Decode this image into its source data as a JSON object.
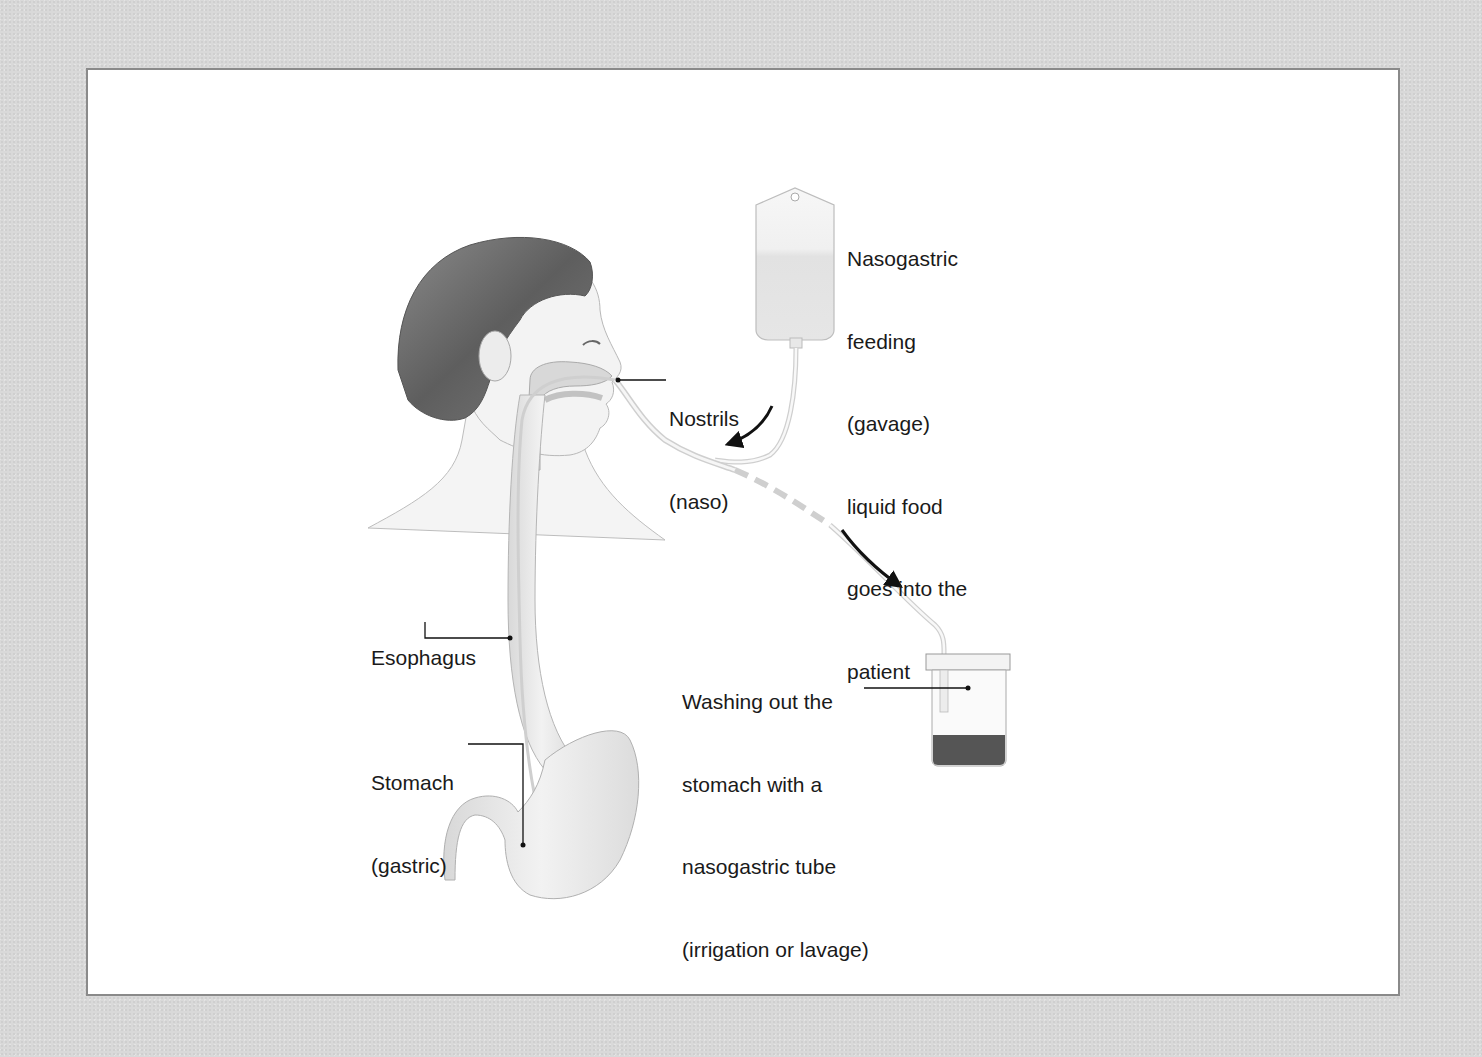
{
  "diagram": {
    "labels": {
      "feeding": {
        "lines": [
          "Nasogastric",
          "feeding",
          "(gavage)",
          "liquid food",
          "goes into the",
          "patient"
        ]
      },
      "nostrils": {
        "lines": [
          "Nostrils",
          "(naso)"
        ]
      },
      "esophagus": {
        "lines": [
          "Esophagus"
        ]
      },
      "stomach": {
        "lines": [
          "Stomach",
          "(gastric)"
        ]
      },
      "washing": {
        "lines": [
          "Washing out the",
          "stomach with a",
          "nasogastric tube",
          "(irrigation or lavage)"
        ]
      }
    },
    "arrows": [
      {
        "name": "flow-into-patient",
        "direction": "down-left"
      },
      {
        "name": "flow-out-to-container",
        "direction": "down-right"
      }
    ],
    "colors": {
      "background": "#d9d9d9",
      "panel": "#ffffff",
      "panel_border": "#8a8a8a",
      "text": "#1a1a1a",
      "hair": "#6e6e6e",
      "skin": "#f0f0f0",
      "organ": "#e6e6e6"
    }
  }
}
